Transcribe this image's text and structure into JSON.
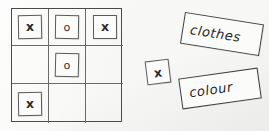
{
  "scene": {
    "kind": "hand-drawn-sketch",
    "background_color": "#f7f7f5",
    "ink_color": "#2b2b2b"
  },
  "grid": {
    "rows": 3,
    "columns": 3,
    "cells": [
      {
        "row": 0,
        "col": 0,
        "token": "x"
      },
      {
        "row": 0,
        "col": 1,
        "token": "o"
      },
      {
        "row": 0,
        "col": 2,
        "token": "x"
      },
      {
        "row": 1,
        "col": 0,
        "token": ""
      },
      {
        "row": 1,
        "col": 1,
        "token": "o"
      },
      {
        "row": 1,
        "col": 2,
        "token": ""
      },
      {
        "row": 2,
        "col": 0,
        "token": "x"
      },
      {
        "row": 2,
        "col": 1,
        "token": ""
      },
      {
        "row": 2,
        "col": 2,
        "token": ""
      }
    ]
  },
  "loose_token": {
    "label": "x"
  },
  "label_cards": [
    {
      "text": "clothes"
    },
    {
      "text": "colour"
    }
  ]
}
